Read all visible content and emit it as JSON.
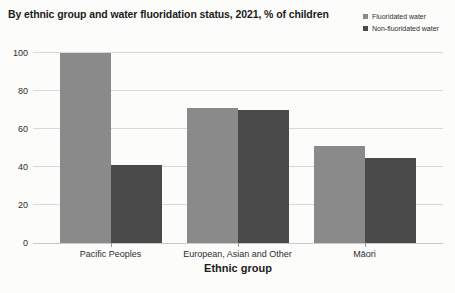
{
  "chart_data": {
    "type": "bar",
    "title": "By ethnic group and water fluoridation status, 2021, % of children",
    "xlabel": "Ethnic group",
    "ylabel": "",
    "categories": [
      "Pacific Peoples",
      "European, Asian and Other",
      "Māori"
    ],
    "series": [
      {
        "name": "Fluoridated water",
        "color": "#8a8a8a",
        "values": [
          100,
          71,
          51
        ]
      },
      {
        "name": "Non-fluoridated water",
        "color": "#4a4a4a",
        "values": [
          41,
          70,
          45
        ]
      }
    ],
    "yticks": [
      0,
      20,
      40,
      60,
      80,
      100
    ],
    "ylim": [
      0,
      100
    ],
    "grid": true,
    "legend_position": "top-right"
  },
  "colors": {
    "background": "#fcfcfa",
    "gridline": "#d9d9d9",
    "axis_text": "#2e2e2e",
    "title_text": "#1c1c1c"
  }
}
